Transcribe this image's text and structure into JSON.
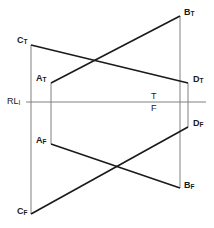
{
  "figure": {
    "type": "engineering-drawing",
    "width": 214,
    "height": 228,
    "background_color": "#ffffff",
    "stroke_color_heavy": "#1a1a1a",
    "stroke_color_light": "#808080",
    "reference_line": {
      "label_main": "RL",
      "label_sub": "I",
      "y": 102,
      "x_start": 26,
      "x_end": 206
    },
    "mid_markers": [
      {
        "name": "t-marker",
        "text": "T",
        "x": 151,
        "y": 92
      },
      {
        "name": "f-marker",
        "text": "F",
        "x": 151,
        "y": 104
      }
    ],
    "points": [
      {
        "id": "CT",
        "main": "C",
        "sub": "T",
        "x": 31,
        "y": 45,
        "label_x": 17,
        "label_y": 36
      },
      {
        "id": "AT",
        "main": "A",
        "sub": "T",
        "x": 51,
        "y": 83,
        "label_x": 36,
        "label_y": 74
      },
      {
        "id": "AF",
        "main": "A",
        "sub": "F",
        "x": 51,
        "y": 144,
        "label_x": 36,
        "label_y": 136
      },
      {
        "id": "CF",
        "main": "C",
        "sub": "F",
        "x": 31,
        "y": 214,
        "label_x": 17,
        "label_y": 207
      },
      {
        "id": "BT",
        "main": "B",
        "sub": "T",
        "x": 180,
        "y": 16,
        "label_x": 184,
        "label_y": 8
      },
      {
        "id": "DT",
        "main": "D",
        "sub": "T",
        "x": 188,
        "y": 83,
        "label_x": 193,
        "label_y": 75
      },
      {
        "id": "DF",
        "main": "D",
        "sub": "F",
        "x": 188,
        "y": 127,
        "label_x": 193,
        "label_y": 119
      },
      {
        "id": "BF",
        "main": "B",
        "sub": "F",
        "x": 180,
        "y": 188,
        "label_x": 184,
        "label_y": 181
      }
    ],
    "heavy_lines": [
      {
        "name": "line-CT-DT",
        "from": "CT",
        "to": "DT",
        "x1": 31,
        "y1": 45,
        "x2": 188,
        "y2": 83
      },
      {
        "name": "line-AT-BT",
        "from": "AT",
        "to": "BT",
        "x1": 51,
        "y1": 83,
        "x2": 180,
        "y2": 16
      },
      {
        "name": "line-AF-BF",
        "from": "AF",
        "to": "BF",
        "x1": 51,
        "y1": 144,
        "x2": 180,
        "y2": 188
      },
      {
        "name": "line-CF-DF",
        "from": "CF",
        "to": "DF",
        "x1": 31,
        "y1": 214,
        "x2": 188,
        "y2": 127
      }
    ],
    "light_lines": [
      {
        "name": "projector-C",
        "x1": 31,
        "y1": 45,
        "x2": 31,
        "y2": 214
      },
      {
        "name": "projector-A",
        "x1": 51,
        "y1": 83,
        "x2": 51,
        "y2": 144
      },
      {
        "name": "projector-B",
        "x1": 180,
        "y1": 16,
        "x2": 180,
        "y2": 188
      },
      {
        "name": "projector-D",
        "x1": 188,
        "y1": 83,
        "x2": 188,
        "y2": 127
      }
    ],
    "intersections": [
      {
        "name": "upper-crossing",
        "x": 91,
        "y": 60
      },
      {
        "name": "lower-crossing",
        "x": 117,
        "y": 165
      }
    ]
  }
}
